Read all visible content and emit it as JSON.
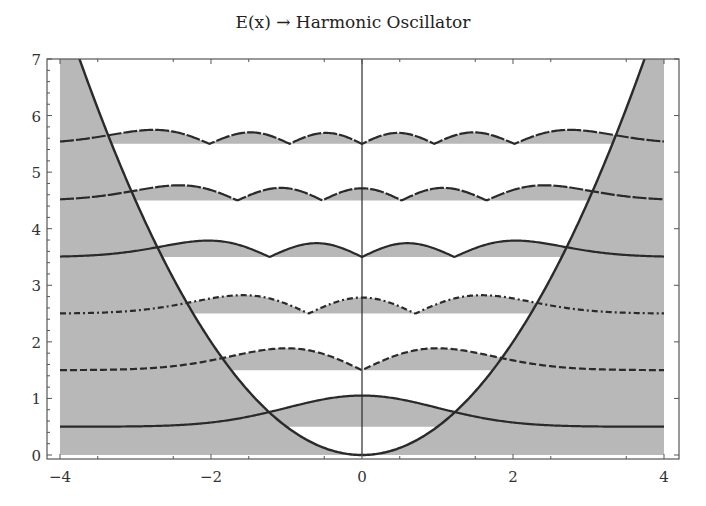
{
  "chart_data": {
    "type": "line",
    "title": "E(x) → Harmonic Oscillator",
    "xlabel": "",
    "ylabel": "",
    "xlim": [
      -4,
      4
    ],
    "ylim": [
      0,
      7
    ],
    "x_ticks": [
      -4,
      -2,
      0,
      2,
      4
    ],
    "y_ticks": [
      0,
      1,
      2,
      3,
      4,
      5,
      6,
      7
    ],
    "grid": false,
    "legend": null,
    "potential": {
      "name": "V(x) = x^2/2",
      "style": "solid"
    },
    "series": [
      {
        "name": "n=0",
        "energy": 0.5,
        "n": 0,
        "style": "solid",
        "amplitude": 0.55
      },
      {
        "name": "n=1",
        "energy": 1.5,
        "n": 1,
        "style": "dashed",
        "amplitude": 0.45
      },
      {
        "name": "n=2",
        "energy": 2.5,
        "n": 2,
        "style": "dashdot",
        "amplitude": 0.4
      },
      {
        "name": "n=3",
        "energy": 3.5,
        "n": 3,
        "style": "solid",
        "amplitude": 0.37
      },
      {
        "name": "n=4",
        "energy": 4.5,
        "n": 4,
        "style": "longdash",
        "amplitude": 0.35
      },
      {
        "name": "n=5",
        "energy": 5.5,
        "n": 5,
        "style": "longdash",
        "amplitude": 0.33
      }
    ],
    "annotations": [
      "Shaded regions: classically forbidden zones and |psi| area above each energy level"
    ]
  },
  "colors": {
    "shade": "#b8b8b8",
    "line": "#2a2a2a",
    "frame": "#555555",
    "background": "#ffffff"
  }
}
